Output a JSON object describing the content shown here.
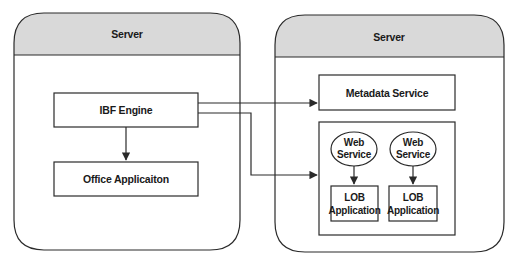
{
  "left_server": {
    "title": "Server",
    "components": {
      "ibf_engine": "IBF Engine",
      "office_application": "Office Applicaiton"
    }
  },
  "right_server": {
    "title": "Server",
    "components": {
      "metadata_service": "Metadata Service",
      "web_service_1": {
        "line1": "Web",
        "line2": "Service"
      },
      "web_service_2": {
        "line1": "Web",
        "line2": "Service"
      },
      "lob_application_1": {
        "line1": "LOB",
        "line2": "Application"
      },
      "lob_application_2": {
        "line1": "LOB",
        "line2": "Application"
      }
    }
  },
  "colors": {
    "header_fill": "#d9d9d9",
    "stroke": "#2a2a2a",
    "background": "#ffffff"
  }
}
